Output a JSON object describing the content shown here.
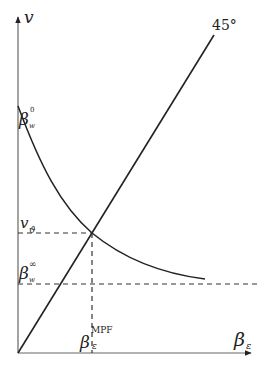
{
  "diagram": {
    "y_axis_label": "v",
    "x_axis_label_base": "β",
    "x_axis_label_sub": "ε",
    "line_45_label": "45°",
    "labels": {
      "beta_w0_base": "β",
      "beta_w0_sub": "w",
      "beta_w0_sup": "0",
      "v_theta_base": "v",
      "v_theta_sub": "ϑ",
      "beta_winf_base": "β",
      "beta_winf_sub": "w",
      "beta_winf_sup": "∞",
      "beta_mpf_base": "β",
      "beta_mpf_sub": "ε",
      "beta_mpf_sup": "MPF"
    },
    "colors": {
      "axis": "#555555",
      "curve": "#222222",
      "dashed": "#333333"
    }
  }
}
